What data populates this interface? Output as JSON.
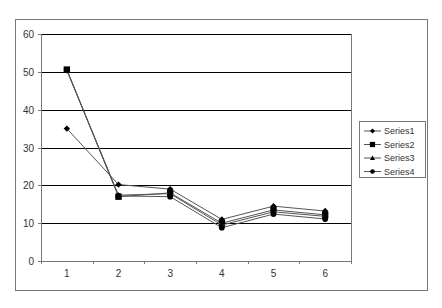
{
  "chart_data": {
    "type": "line",
    "title": "",
    "xlabel": "",
    "ylabel": "",
    "categories": [
      "1",
      "2",
      "3",
      "4",
      "5",
      "6"
    ],
    "ylim": [
      0,
      60
    ],
    "yticks": [
      0,
      10,
      20,
      30,
      40,
      50,
      60
    ],
    "grid": {
      "horizontal": true,
      "vertical": false
    },
    "legend_position": "right",
    "series": [
      {
        "name": "Series1",
        "marker": "diamond",
        "values": [
          35,
          20.2,
          19,
          11,
          14.5,
          13.2
        ]
      },
      {
        "name": "Series2",
        "marker": "square",
        "values": [
          50.6,
          17,
          18,
          10,
          13.5,
          12.2
        ]
      },
      {
        "name": "Series3",
        "marker": "triangle",
        "values": [
          50.5,
          17.4,
          17.8,
          9.5,
          13,
          11.8
        ]
      },
      {
        "name": "Series4",
        "marker": "circle",
        "values": [
          50.4,
          17.2,
          17,
          8.8,
          12.4,
          11.1
        ]
      }
    ]
  },
  "colors": {
    "series_line": "#555555",
    "marker": "#000000",
    "gridline": "#000000",
    "frame": "#777777"
  }
}
